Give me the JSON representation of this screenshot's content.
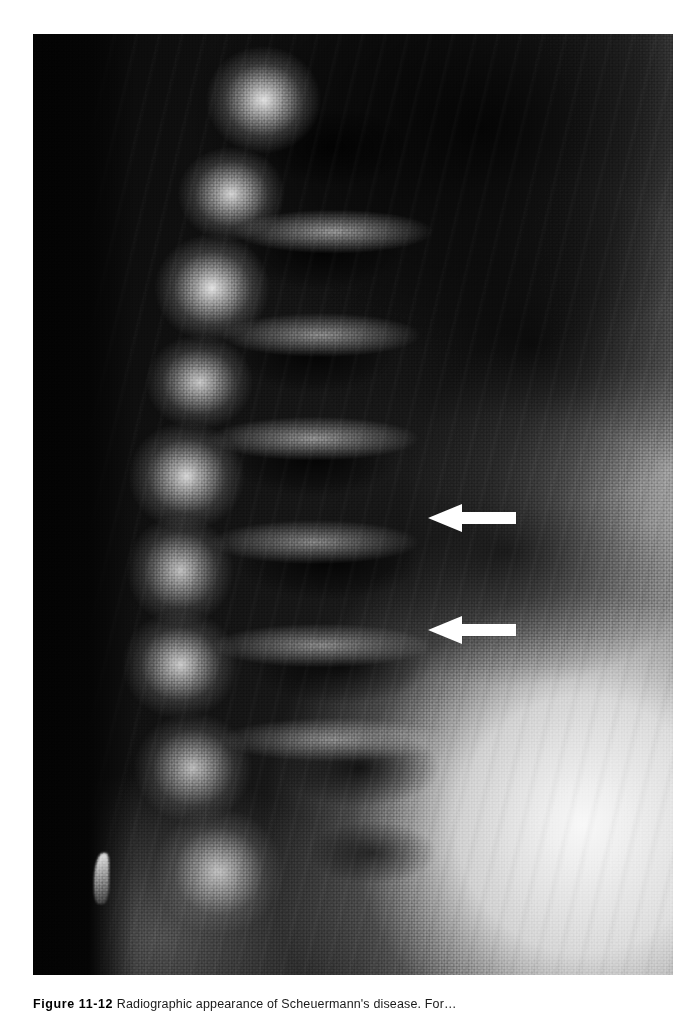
{
  "figure": {
    "label": "Figure 11-12",
    "caption_body": "Radiographic appearance of Scheuermann's disease. For…",
    "caption_full": "Figure 11-12 Radiographic appearance of Scheuermann's disease. For",
    "alt": "Lateral radiograph of the thoracolumbar spine showing anterior vertebral body wedging and irregular endplates"
  },
  "radiograph": {
    "modality": "x-ray",
    "view": "lateral spine",
    "background_color": "#0a0a0a",
    "soft_tissue_color": "#ededed",
    "bone_color": "#e8e8e8",
    "plate": {
      "x": 33,
      "y": 34,
      "width": 640,
      "height": 941
    }
  },
  "annotations": {
    "arrow_color": "#ffffff",
    "arrows": [
      {
        "name": "upper-arrow",
        "direction": "left",
        "x": 428,
        "y": 502,
        "width": 88,
        "height": 32,
        "points_at": "anterior vertebral body wedging"
      },
      {
        "name": "lower-arrow",
        "direction": "left",
        "x": 428,
        "y": 614,
        "width": 88,
        "height": 32,
        "points_at": "irregular vertebral endplate"
      }
    ]
  },
  "page": {
    "background_color": "#ffffff",
    "width": 698,
    "height": 1014
  }
}
